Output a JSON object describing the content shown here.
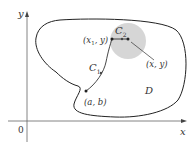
{
  "diagram": {
    "axes": {
      "x_label": "x",
      "y_label": "y",
      "origin_label": "0"
    },
    "region": {
      "label": "D"
    },
    "disk": {
      "color": "#d6d6d6"
    },
    "curves": {
      "c1": {
        "label": "C",
        "subscript": "1"
      },
      "c2": {
        "label": "C",
        "subscript": "2"
      }
    },
    "points": {
      "start": {
        "label": "(a, b)"
      },
      "intermediate": {
        "label_pre": "(x",
        "label_sub": "1",
        "label_post": ", y)"
      },
      "end": {
        "label": "(x, y)"
      }
    },
    "colors": {
      "stroke": "#222222",
      "axis": "#555555",
      "background": "#ffffff"
    }
  }
}
